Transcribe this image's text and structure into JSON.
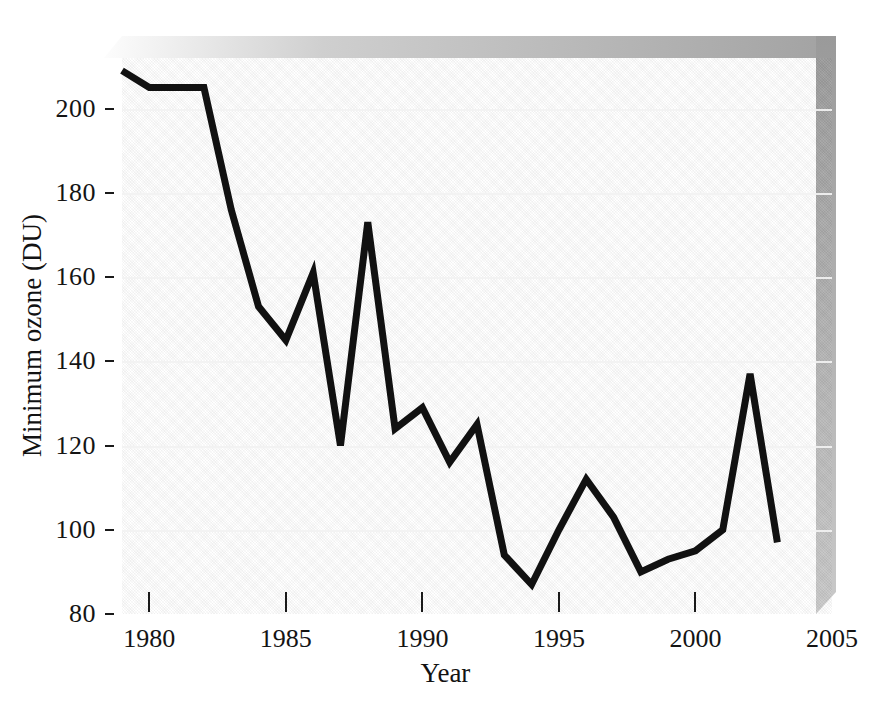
{
  "chart_data": {
    "type": "line",
    "title": "",
    "xlabel": "Year",
    "ylabel": "Minimum ozone (DU)",
    "xlim": [
      1979,
      2005
    ],
    "ylim": [
      80,
      212
    ],
    "xticks": [
      1980,
      1985,
      1990,
      1995,
      2000,
      2005
    ],
    "yticks": [
      80,
      100,
      120,
      140,
      160,
      180,
      200
    ],
    "grid": "horizontal",
    "legend": "none",
    "line_color": "#111111",
    "panel_style": "3d-gray-gradient",
    "x": [
      1979,
      1980,
      1981,
      1982,
      1983,
      1984,
      1985,
      1986,
      1987,
      1988,
      1989,
      1990,
      1991,
      1992,
      1993,
      1994,
      1995,
      1996,
      1997,
      1998,
      1999,
      2000,
      2001,
      2002,
      2003
    ],
    "values": [
      209,
      205,
      205,
      205,
      176,
      153,
      145,
      161,
      120,
      173,
      124,
      129,
      116,
      125,
      94,
      87,
      100,
      112,
      103,
      90,
      93,
      95,
      100,
      137,
      97
    ],
    "series": [
      {
        "name": "Minimum ozone",
        "values": [
          209,
          205,
          205,
          205,
          176,
          153,
          145,
          161,
          120,
          173,
          124,
          129,
          116,
          125,
          94,
          87,
          100,
          112,
          103,
          90,
          93,
          95,
          100,
          137,
          97
        ]
      }
    ]
  },
  "axes": {
    "y_tick_labels": [
      "200",
      "180",
      "160",
      "140",
      "120",
      "100",
      "80"
    ],
    "y_tick_values": [
      200,
      180,
      160,
      140,
      120,
      100,
      80
    ],
    "x_tick_labels": [
      "1980",
      "1985",
      "1990",
      "1995",
      "2000",
      "2005"
    ],
    "x_tick_values": [
      1980,
      1985,
      1990,
      1995,
      2000,
      2005
    ],
    "x_axis_title": "Year",
    "y_axis_title": "Minimum ozone (DU)"
  }
}
